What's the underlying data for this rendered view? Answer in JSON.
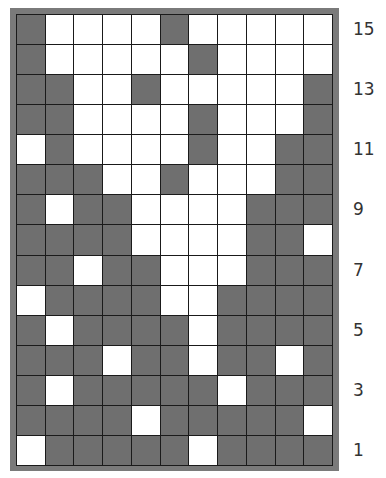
{
  "chart": {
    "type": "colorwork-chart",
    "columns": 11,
    "rows": 15,
    "colors": {
      "dark": "#6f6f6f",
      "light": "#ffffff",
      "grid_line": "#1a1a1a",
      "frame": "#7a7a7a",
      "label": "#333333"
    },
    "legend_note": "grid rows listed top to bottom (row 15 first); 1 = dark cell, 0 = white cell",
    "grid": [
      {
        "row": 15,
        "cells": [
          1,
          0,
          0,
          0,
          0,
          1,
          0,
          0,
          0,
          0,
          0
        ]
      },
      {
        "row": 14,
        "cells": [
          1,
          0,
          0,
          0,
          0,
          0,
          1,
          0,
          0,
          0,
          0
        ]
      },
      {
        "row": 13,
        "cells": [
          1,
          1,
          0,
          0,
          1,
          0,
          0,
          0,
          0,
          0,
          1
        ]
      },
      {
        "row": 12,
        "cells": [
          1,
          1,
          0,
          0,
          0,
          0,
          1,
          0,
          0,
          0,
          1
        ]
      },
      {
        "row": 11,
        "cells": [
          0,
          1,
          0,
          0,
          0,
          0,
          1,
          0,
          0,
          1,
          1
        ]
      },
      {
        "row": 10,
        "cells": [
          1,
          1,
          1,
          0,
          0,
          1,
          0,
          0,
          0,
          1,
          1
        ]
      },
      {
        "row": 9,
        "cells": [
          1,
          0,
          1,
          1,
          0,
          0,
          0,
          0,
          1,
          1,
          1
        ]
      },
      {
        "row": 8,
        "cells": [
          1,
          1,
          1,
          1,
          0,
          0,
          0,
          0,
          1,
          1,
          0
        ]
      },
      {
        "row": 7,
        "cells": [
          1,
          1,
          0,
          1,
          1,
          0,
          0,
          0,
          1,
          1,
          1
        ]
      },
      {
        "row": 6,
        "cells": [
          0,
          1,
          1,
          1,
          1,
          0,
          0,
          1,
          1,
          1,
          1
        ]
      },
      {
        "row": 5,
        "cells": [
          1,
          0,
          1,
          1,
          1,
          1,
          0,
          1,
          1,
          1,
          1
        ]
      },
      {
        "row": 4,
        "cells": [
          1,
          1,
          1,
          0,
          1,
          1,
          0,
          1,
          1,
          0,
          1
        ]
      },
      {
        "row": 3,
        "cells": [
          1,
          0,
          1,
          1,
          1,
          1,
          1,
          0,
          1,
          1,
          1
        ]
      },
      {
        "row": 2,
        "cells": [
          1,
          1,
          1,
          1,
          0,
          1,
          1,
          1,
          1,
          1,
          0
        ]
      },
      {
        "row": 1,
        "cells": [
          0,
          1,
          1,
          1,
          1,
          1,
          0,
          1,
          1,
          1,
          1
        ]
      }
    ],
    "row_labels": [
      "15",
      "",
      "13",
      "",
      "11",
      "",
      "9",
      "",
      "7",
      "",
      "5",
      "",
      "3",
      "",
      "1"
    ]
  }
}
